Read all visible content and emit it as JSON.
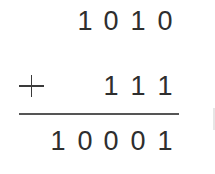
{
  "problem": {
    "operation": "binary addition",
    "operator": "+",
    "addend1": [
      "1",
      "0",
      "1",
      "0"
    ],
    "addend2": [
      "1",
      "1",
      "1"
    ],
    "sum": [
      "1",
      "0",
      "0",
      "0",
      "1"
    ],
    "addend1_text": "1010",
    "addend2_text": "111",
    "sum_text": "10001"
  },
  "colors": {
    "text": "#2e2e2e",
    "rule": "#555555",
    "background": "#ffffff"
  }
}
